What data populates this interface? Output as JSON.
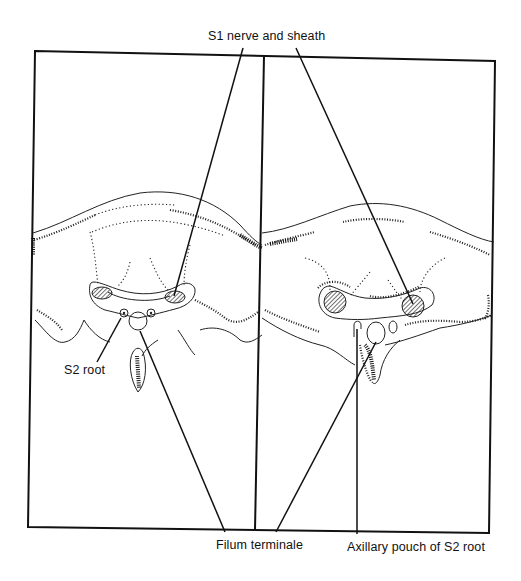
{
  "figure": {
    "type": "anatomical cross-section diagram",
    "panels": [
      {
        "id": "left",
        "description": "Sacral cross-section, left panel"
      },
      {
        "id": "right",
        "description": "Sacral cross-section, right panel"
      }
    ]
  },
  "labels": {
    "s1_nerve": "S1 nerve and sheath",
    "s2_root": "S2 root",
    "filum": "Filum terminale",
    "axillary": "Axillary pouch of S2 root"
  },
  "colors": {
    "ink": "#111111",
    "background": "#ffffff"
  }
}
